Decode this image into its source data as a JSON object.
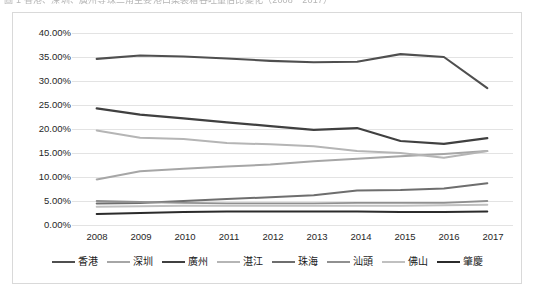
{
  "caption": {
    "text": "圖 1  香港、深圳、廣州等珠三角主要港口集裝箱吞吐量佔比變化（2008－2017）"
  },
  "chart_data": {
    "type": "line",
    "title": "",
    "subtitle": "",
    "xlabel": "",
    "ylabel": "",
    "grid": true,
    "legend_position": "bottom",
    "categories": [
      "2008",
      "2009",
      "2010",
      "2011",
      "2012",
      "2013",
      "2014",
      "2015",
      "2016",
      "2017"
    ],
    "x": [
      2008,
      2009,
      2010,
      2011,
      2012,
      2013,
      2014,
      2015,
      2016,
      2017
    ],
    "ylim": [
      0,
      40
    ],
    "ytick_labels": [
      "40.00%",
      "35.00%",
      "30.00%",
      "25.00%",
      "20.00%",
      "15.00%",
      "10.00%",
      "5.00%",
      "0.00%"
    ],
    "yticks": [
      40,
      35,
      30,
      25,
      20,
      15,
      10,
      5,
      0
    ],
    "series": [
      {
        "name": "香港",
        "color": "#4f4f4f",
        "width": 2.1,
        "values": [
          34.6,
          35.3,
          35.1,
          34.7,
          34.2,
          33.9,
          34.0,
          35.6,
          35.0,
          28.5
        ]
      },
      {
        "name": "深圳",
        "color": "#a6a6a6",
        "width": 2.0,
        "values": [
          9.5,
          11.2,
          11.7,
          12.2,
          12.6,
          13.3,
          13.8,
          14.3,
          14.8,
          15.4
        ]
      },
      {
        "name": "廣州",
        "color": "#404040",
        "width": 2.2,
        "values": [
          24.3,
          23.0,
          22.2,
          21.4,
          20.6,
          19.8,
          20.2,
          17.5,
          16.9,
          18.1
        ]
      },
      {
        "name": "湛江",
        "color": "#b5b5b5",
        "width": 2.0,
        "values": [
          19.7,
          18.2,
          17.9,
          17.1,
          16.8,
          16.4,
          15.4,
          15.0,
          14.0,
          15.4
        ]
      },
      {
        "name": "珠海",
        "color": "#6e6e6e",
        "width": 2.0,
        "values": [
          4.5,
          4.6,
          5.0,
          5.4,
          5.8,
          6.2,
          7.2,
          7.3,
          7.6,
          8.7
        ]
      },
      {
        "name": "汕頭",
        "color": "#909090",
        "width": 1.9,
        "values": [
          5.0,
          4.8,
          4.6,
          4.5,
          4.5,
          4.5,
          4.6,
          4.6,
          4.6,
          5.0
        ]
      },
      {
        "name": "佛山",
        "color": "#c0c0c0",
        "width": 2.0,
        "values": [
          3.8,
          3.9,
          4.0,
          4.0,
          4.0,
          4.0,
          4.0,
          4.0,
          4.1,
          4.2
        ]
      },
      {
        "name": "肇慶",
        "color": "#2b2b2b",
        "width": 2.0,
        "values": [
          2.3,
          2.5,
          2.7,
          2.8,
          2.8,
          2.8,
          2.8,
          2.7,
          2.7,
          2.8
        ]
      }
    ]
  },
  "axis": {
    "y_labels": [
      "40.00%",
      "35.00%",
      "30.00%",
      "25.00%",
      "20.00%",
      "15.00%",
      "10.00%",
      "5.00%",
      "0.00%"
    ],
    "x_labels": [
      "2008",
      "2009",
      "2010",
      "2011",
      "2012",
      "2013",
      "2014",
      "2015",
      "2016",
      "2017"
    ]
  },
  "style": {
    "plot_background": "#ffffff",
    "border_color": "#d9d9d9",
    "gridline_color": "#e3e3e3",
    "text_color": "#272727"
  }
}
